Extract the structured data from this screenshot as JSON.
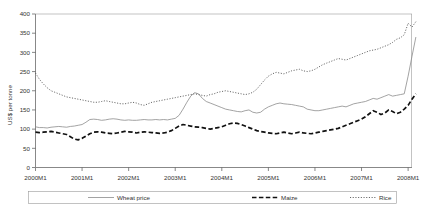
{
  "chart_data": {
    "type": "line",
    "title": "",
    "xlabel": "",
    "ylabel": "US$ per tonne",
    "ylim": [
      0,
      400
    ],
    "yticks": [
      0,
      50,
      100,
      150,
      200,
      250,
      300,
      350,
      400
    ],
    "ytick_labels": [
      "0",
      "50",
      "100",
      "150",
      "200",
      "250",
      "300",
      "350",
      "400"
    ],
    "xlim": [
      0,
      97
    ],
    "xticks": [
      0,
      12,
      24,
      36,
      48,
      60,
      72,
      84,
      96
    ],
    "xtick_labels": [
      "2000M1",
      "2001M1",
      "2002M1",
      "2003M1",
      "2004M1",
      "2005M1",
      "2006M1",
      "2007M1",
      "2008M1"
    ],
    "grid": false,
    "legend_position": "bottom",
    "series": [
      {
        "name": "Wheat price",
        "style": "solid",
        "color": "#8c8c8c",
        "width": 0.8,
        "values": [
          106,
          104,
          104,
          103,
          105,
          106,
          107,
          106,
          105,
          107,
          108,
          110,
          112,
          118,
          125,
          126,
          125,
          123,
          124,
          126,
          127,
          126,
          124,
          123,
          124,
          123,
          123,
          124,
          125,
          124,
          124,
          125,
          124,
          125,
          124,
          126,
          128,
          136,
          152,
          170,
          186,
          195,
          192,
          180,
          172,
          168,
          164,
          160,
          156,
          152,
          150,
          148,
          146,
          145,
          148,
          150,
          144,
          142,
          144,
          152,
          158,
          162,
          166,
          168,
          166,
          165,
          164,
          162,
          160,
          158,
          152,
          150,
          148,
          148,
          150,
          152,
          154,
          156,
          158,
          160,
          158,
          162,
          166,
          168,
          170,
          172,
          176,
          180,
          178,
          182,
          186,
          190,
          186,
          188,
          190,
          192,
          238,
          290,
          340
        ]
      },
      {
        "name": "Maize",
        "style": "dashed",
        "color": "#111111",
        "width": 1.7,
        "values": [
          92,
          91,
          92,
          93,
          94,
          92,
          90,
          88,
          86,
          80,
          74,
          72,
          76,
          82,
          88,
          92,
          93,
          92,
          90,
          89,
          88,
          90,
          92,
          94,
          93,
          92,
          90,
          92,
          93,
          92,
          91,
          90,
          89,
          90,
          92,
          96,
          102,
          108,
          112,
          110,
          108,
          106,
          105,
          104,
          102,
          100,
          102,
          104,
          106,
          110,
          114,
          116,
          115,
          112,
          108,
          104,
          100,
          96,
          94,
          92,
          90,
          89,
          88,
          90,
          92,
          90,
          88,
          90,
          92,
          90,
          89,
          88,
          90,
          92,
          94,
          96,
          98,
          100,
          102,
          106,
          110,
          114,
          118,
          122,
          126,
          132,
          140,
          148,
          144,
          138,
          142,
          150,
          146,
          140,
          144,
          152,
          162,
          178,
          192
        ]
      },
      {
        "name": "Rice",
        "style": "dotted",
        "color": "#555555",
        "width": 0.9,
        "values": [
          246,
          230,
          218,
          208,
          200,
          196,
          192,
          188,
          184,
          182,
          180,
          178,
          176,
          174,
          172,
          170,
          170,
          172,
          174,
          172,
          170,
          168,
          166,
          166,
          168,
          170,
          168,
          164,
          162,
          166,
          170,
          172,
          174,
          176,
          178,
          180,
          182,
          184,
          186,
          188,
          190,
          192,
          190,
          188,
          186,
          190,
          192,
          196,
          198,
          200,
          198,
          196,
          194,
          192,
          190,
          192,
          196,
          204,
          216,
          228,
          238,
          244,
          248,
          246,
          244,
          248,
          252,
          254,
          256,
          252,
          250,
          252,
          256,
          262,
          268,
          272,
          276,
          280,
          284,
          282,
          280,
          284,
          288,
          292,
          296,
          300,
          304,
          306,
          308,
          312,
          316,
          320,
          326,
          334,
          338,
          346,
          376,
          366,
          380
        ]
      }
    ]
  },
  "legend": {
    "items": [
      {
        "label": "Wheat price"
      },
      {
        "label": "Maize"
      },
      {
        "label": "Rice"
      }
    ]
  }
}
